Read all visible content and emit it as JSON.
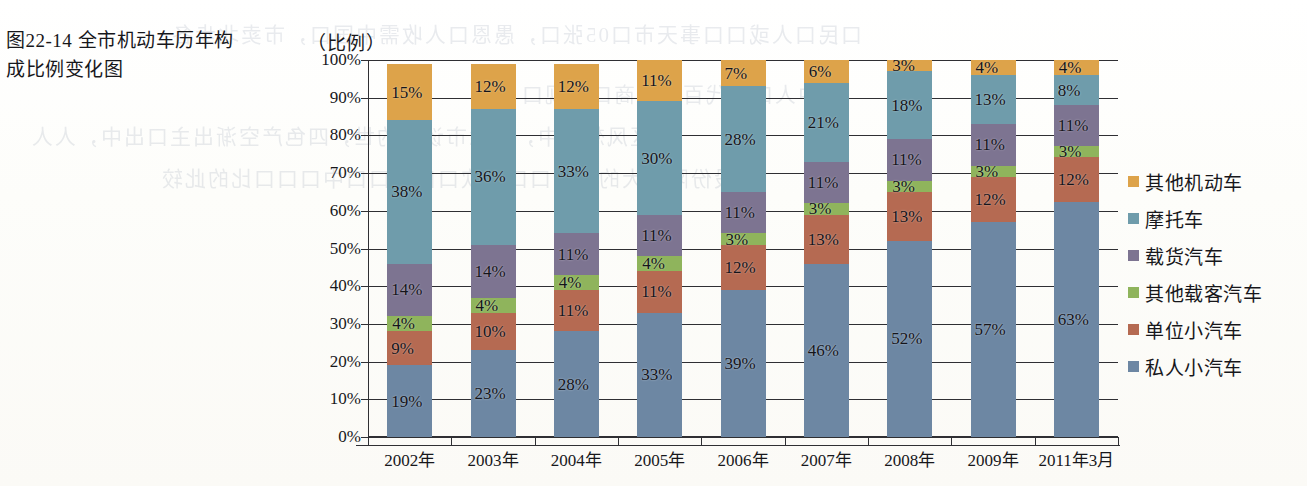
{
  "caption": "图22-14 全市机动车历年构成比例变化图",
  "ghost_text": [
    "口民口人或口口事天市口05张口，愚恩口人收需中国口，市卖北步各",
    "中人口中代百户代商口，观口",
    "古区风想小中，赛念市谈到的世，四色产空渐出主口出中，人人",
    "的股份限价大的水引口口，欢口口口口口中口口口比的此较"
  ],
  "legend": {
    "items": [
      {
        "label": "其他机动车",
        "color": "#dda34a"
      },
      {
        "label": "摩托车",
        "color": "#6f9cab"
      },
      {
        "label": "载货汽车",
        "color": "#7d7491"
      },
      {
        "label": "其他载客汽车",
        "color": "#8fb45c"
      },
      {
        "label": "单位小汽车",
        "color": "#b56a52"
      },
      {
        "label": "私人小汽车",
        "color": "#6d87a3"
      }
    ]
  },
  "chart_data": {
    "type": "bar",
    "stacked": true,
    "title": "图22-14 全市机动车历年构成比例变化图",
    "xlabel": "",
    "ylabel": "（比例）",
    "ylim": [
      0,
      100
    ],
    "yticks": [
      "0%",
      "10%",
      "20%",
      "30%",
      "40%",
      "50%",
      "60%",
      "70%",
      "80%",
      "90%",
      "100%"
    ],
    "grid": true,
    "legend_position": "right",
    "value_suffix": "%",
    "categories": [
      "2002年",
      "2003年",
      "2004年",
      "2005年",
      "2006年",
      "2007年",
      "2008年",
      "2009年",
      "2011年3月"
    ],
    "series": [
      {
        "name": "私人小汽车",
        "color": "#6d87a3",
        "values": [
          19,
          23,
          28,
          33,
          39,
          46,
          52,
          57,
          63
        ]
      },
      {
        "name": "单位小汽车",
        "color": "#b56a52",
        "values": [
          9,
          10,
          11,
          11,
          12,
          13,
          13,
          12,
          12
        ]
      },
      {
        "name": "其他载客汽车",
        "color": "#8fb45c",
        "values": [
          4,
          4,
          4,
          4,
          3,
          3,
          3,
          3,
          3
        ]
      },
      {
        "name": "载货汽车",
        "color": "#7d7491",
        "values": [
          14,
          14,
          11,
          11,
          11,
          11,
          11,
          11,
          11
        ]
      },
      {
        "name": "摩托车",
        "color": "#6f9cab",
        "values": [
          38,
          36,
          33,
          30,
          28,
          21,
          18,
          13,
          8
        ]
      },
      {
        "name": "其他机动车",
        "color": "#dda34a",
        "values": [
          15,
          12,
          12,
          11,
          7,
          6,
          3,
          4,
          4
        ]
      }
    ]
  }
}
